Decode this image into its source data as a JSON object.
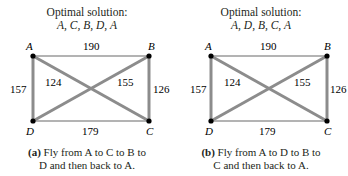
{
  "colors": {
    "edge_unused": "#b3b3b3",
    "edge_route": "#8c8c8c",
    "node": "#000000",
    "text": "#231f20"
  },
  "diagrams": [
    {
      "title": "Optimal solution:",
      "sequence": "A, C, B, D, A",
      "nodes": {
        "A": "A",
        "B": "B",
        "C": "C",
        "D": "D"
      },
      "weights": {
        "AB": "190",
        "AC": "124",
        "BD": "155",
        "BC": "126",
        "AD": "157",
        "DC": "179"
      },
      "caption": {
        "tag": "(a)",
        "line1": "Fly from A to C to B to",
        "line2": "D and then back to A."
      }
    },
    {
      "title": "Optimal solution:",
      "sequence": "A, D, B, C, A",
      "nodes": {
        "A": "A",
        "B": "B",
        "C": "C",
        "D": "D"
      },
      "weights": {
        "AB": "190",
        "AC": "124",
        "BD": "155",
        "BC": "126",
        "AD": "157",
        "DC": "179"
      },
      "caption": {
        "tag": "(b)",
        "line1": "Fly from A to D to B to",
        "line2": "C and then back to A."
      }
    }
  ]
}
